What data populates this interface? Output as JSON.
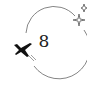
{
  "badge": {
    "number": "8",
    "icons": [
      "airplane-icon",
      "sparkle-icon"
    ],
    "colors": {
      "stroke": "#555555",
      "plane": "#111111",
      "background": "#ffffff"
    }
  }
}
